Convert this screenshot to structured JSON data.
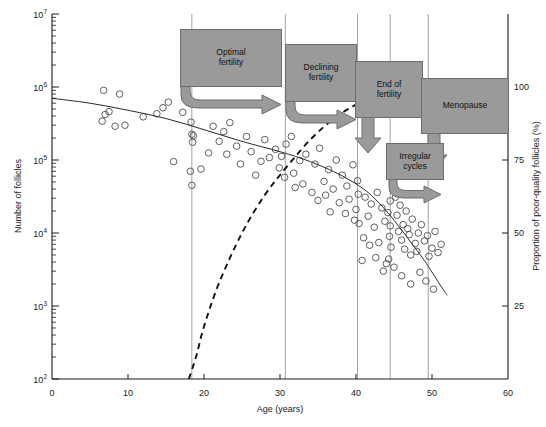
{
  "chart_data": {
    "type": "scatter",
    "title": "",
    "xlabel": "Age (years)",
    "ylabel": "Number of follicles",
    "y2label": "Proportion of poor-quality follicles (%)",
    "xlim": [
      0,
      60
    ],
    "ylim": [
      100,
      10000000
    ],
    "yscale": "log",
    "y2lim": [
      0,
      125
    ],
    "grid": "vertical-only",
    "legend": "none",
    "xticks": [
      0,
      10,
      20,
      30,
      40,
      50,
      60
    ],
    "xtick_labels": [
      "0",
      "10",
      "20",
      "30",
      "40",
      "50",
      "60"
    ],
    "yticks": [
      100,
      1000,
      10000,
      100000,
      1000000,
      10000000
    ],
    "ytick_labels": [
      "10²",
      "10³",
      "10⁴",
      "10⁵",
      "10⁶",
      "10⁷"
    ],
    "ytick_bases": [
      "10",
      "10",
      "10",
      "10",
      "10",
      "10"
    ],
    "ytick_exps": [
      "2",
      "3",
      "4",
      "5",
      "6",
      "7"
    ],
    "y2ticks": [
      25,
      50,
      75,
      100
    ],
    "y2tick_labels": [
      "25",
      "50",
      "75",
      "100"
    ],
    "vertical_gridlines": [
      18.4,
      30.7,
      40.2,
      44.5,
      49.5
    ],
    "series": [
      {
        "name": "Number of follicles",
        "type": "scatter",
        "marker": "open-circle",
        "points": [
          [
            6.8,
            900000
          ],
          [
            8.9,
            800000
          ],
          [
            7.5,
            460000
          ],
          [
            6.6,
            340000
          ],
          [
            8.3,
            290000
          ],
          [
            7.0,
            420000
          ],
          [
            9.6,
            300000
          ],
          [
            13.8,
            430000
          ],
          [
            14.6,
            520000
          ],
          [
            15.3,
            620000
          ],
          [
            12.0,
            390000
          ],
          [
            17.2,
            450000
          ],
          [
            16.0,
            95000
          ],
          [
            18.3,
            330000
          ],
          [
            18.6,
            215000
          ],
          [
            18.4,
            225000
          ],
          [
            18.5,
            175000
          ],
          [
            18.2,
            70000
          ],
          [
            18.4,
            45000
          ],
          [
            21.2,
            290000
          ],
          [
            22.6,
            245000
          ],
          [
            23.4,
            325000
          ],
          [
            22.0,
            180000
          ],
          [
            24.3,
            155000
          ],
          [
            25.6,
            210000
          ],
          [
            23.0,
            120000
          ],
          [
            26.2,
            130000
          ],
          [
            27.5,
            96000
          ],
          [
            24.8,
            88000
          ],
          [
            28.6,
            108000
          ],
          [
            29.4,
            140000
          ],
          [
            26.8,
            62000
          ],
          [
            29.9,
            78000
          ],
          [
            30.8,
            165000
          ],
          [
            30.6,
            58000
          ],
          [
            31.5,
            210000
          ],
          [
            32.6,
            98000
          ],
          [
            33.4,
            120000
          ],
          [
            31.8,
            66000
          ],
          [
            34.6,
            88000
          ],
          [
            35.2,
            145000
          ],
          [
            33.0,
            47000
          ],
          [
            36.4,
            74000
          ],
          [
            35.8,
            51000
          ],
          [
            37.4,
            100000
          ],
          [
            36.0,
            33000
          ],
          [
            38.2,
            62000
          ],
          [
            37.0,
            40000
          ],
          [
            38.8,
            44000
          ],
          [
            39.6,
            86000
          ],
          [
            39.1,
            29000
          ],
          [
            40.2,
            52000
          ],
          [
            40.3,
            34000
          ],
          [
            40.0,
            21000
          ],
          [
            40.4,
            13500
          ],
          [
            41.2,
            31000
          ],
          [
            42.0,
            25000
          ],
          [
            41.6,
            17000
          ],
          [
            42.8,
            36000
          ],
          [
            43.4,
            22000
          ],
          [
            42.4,
            12000
          ],
          [
            43.8,
            14500
          ],
          [
            44.2,
            19000
          ],
          [
            44.5,
            27500
          ],
          [
            44.5,
            12500
          ],
          [
            44.4,
            9000
          ],
          [
            44.6,
            6400
          ],
          [
            44.3,
            4400
          ],
          [
            45.2,
            31000
          ],
          [
            45.8,
            24000
          ],
          [
            45.4,
            17500
          ],
          [
            46.2,
            13000
          ],
          [
            46.6,
            20000
          ],
          [
            45.6,
            10500
          ],
          [
            46.0,
            8000
          ],
          [
            46.4,
            6000
          ],
          [
            46.8,
            11500
          ],
          [
            47.4,
            15500
          ],
          [
            47.0,
            9500
          ],
          [
            47.8,
            7200
          ],
          [
            47.2,
            5000
          ],
          [
            48.2,
            10000
          ],
          [
            48.6,
            13000
          ],
          [
            48.0,
            5600
          ],
          [
            49.0,
            7800
          ],
          [
            49.4,
            9200
          ],
          [
            49.6,
            4800
          ],
          [
            50.0,
            6200
          ],
          [
            50.4,
            10500
          ],
          [
            50.8,
            5400
          ],
          [
            51.2,
            7000
          ],
          [
            45.0,
            3400
          ],
          [
            46.0,
            2600
          ],
          [
            47.2,
            2000
          ],
          [
            48.4,
            2900
          ],
          [
            49.2,
            2200
          ],
          [
            50.2,
            1700
          ],
          [
            43.6,
            3000
          ],
          [
            42.6,
            4600
          ],
          [
            41.8,
            6800
          ],
          [
            43.0,
            7400
          ],
          [
            44.0,
            3800
          ],
          [
            41.0,
            8600
          ],
          [
            40.8,
            4200
          ],
          [
            39.8,
            15000
          ],
          [
            38.6,
            18500
          ],
          [
            37.8,
            26000
          ],
          [
            36.6,
            19500
          ],
          [
            35.0,
            28000
          ],
          [
            34.2,
            36000
          ],
          [
            32.0,
            42000
          ],
          [
            30.2,
            112000
          ],
          [
            28.0,
            190000
          ],
          [
            20.6,
            125000
          ],
          [
            19.6,
            75000
          ]
        ]
      },
      {
        "name": "Follicle number decline (fitted curve)",
        "type": "line",
        "style": "solid",
        "points": [
          [
            0.0,
            700000
          ],
          [
            5.0,
            600000
          ],
          [
            10.0,
            480000
          ],
          [
            15.0,
            370000
          ],
          [
            20.0,
            260000
          ],
          [
            25.0,
            180000
          ],
          [
            30.0,
            130000
          ],
          [
            34.0,
            95000
          ],
          [
            38.0,
            62000
          ],
          [
            41.0,
            40000
          ],
          [
            43.0,
            26000
          ],
          [
            45.0,
            15000
          ],
          [
            47.0,
            8000
          ],
          [
            49.0,
            4200
          ],
          [
            51.0,
            2000
          ],
          [
            52.0,
            1400
          ]
        ]
      },
      {
        "name": "Proportion of poor-quality follicles",
        "type": "line",
        "style": "dashed",
        "axis": "right",
        "points": [
          [
            18.0,
            0
          ],
          [
            19.0,
            8
          ],
          [
            20.0,
            18
          ],
          [
            22.0,
            33
          ],
          [
            25.0,
            50
          ],
          [
            28.0,
            63
          ],
          [
            31.0,
            73
          ],
          [
            34.0,
            82
          ],
          [
            37.0,
            89
          ],
          [
            40.0,
            94
          ],
          [
            43.0,
            98
          ],
          [
            46.0,
            100
          ],
          [
            49.0,
            101
          ],
          [
            51.5,
            101
          ]
        ]
      }
    ],
    "annotations": [
      {
        "id": "optimal-fertility",
        "label": "Optimal\nfertility",
        "line1": "Optimal",
        "line2": "fertility"
      },
      {
        "id": "declining-fertility",
        "label": "Declining\nfertility",
        "line1": "Declining",
        "line2": "fertility"
      },
      {
        "id": "end-of-fertility",
        "label": "End of\nfertility",
        "line1": "End of",
        "line2": "fertility"
      },
      {
        "id": "menopause",
        "label": "Menopause",
        "line1": "Menopause",
        "line2": ""
      },
      {
        "id": "irregular-cycles",
        "label": "Irregular\ncycles",
        "line1": "Irregular",
        "line2": "cycles"
      }
    ],
    "colors": {
      "annotation_fill": "#9a9a9a",
      "annotation_stroke": "#6d6d6d",
      "axis": "#1a1a1a",
      "gridline": "#8c8c8c",
      "marker_stroke": "#4d4d4d",
      "curve_solid": "#2b2b2b",
      "curve_dashed": "#111111",
      "background": "#ffffff"
    }
  }
}
